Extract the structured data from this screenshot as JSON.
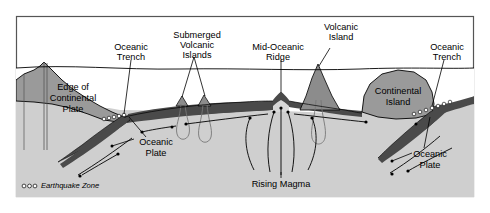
{
  "figure": {
    "kind": "cross-section-diagram",
    "background_color": "#ffffff",
    "border_color": "#555555"
  },
  "palette": {
    "water": "#ffffff",
    "mantle": "#cfcfcf",
    "continental_crust": "#9a9a9a",
    "oceanic_plate": "#4a4a4a",
    "ridge_magma": "#d8d8d8",
    "line": "#000000",
    "earthquake_dot_fill": "#ffffff"
  },
  "labels": {
    "oceanic_trench_left": "Oceanic\nTrench",
    "oceanic_trench_left_line1": "Oceanic",
    "oceanic_trench_left_line2": "Trench",
    "submerged_volcanic_islands_line1": "Submerged",
    "submerged_volcanic_islands_line2": "Volcanic",
    "submerged_volcanic_islands_line3": "Islands",
    "mid_oceanic_ridge_line1": "Mid-Oceanic",
    "mid_oceanic_ridge_line2": "Ridge",
    "volcanic_island_line1": "Volcanic",
    "volcanic_island_line2": "Island",
    "oceanic_trench_right_line1": "Oceanic",
    "oceanic_trench_right_line2": "Trench",
    "edge_of_continental_plate_line1": "Edge of",
    "edge_of_continental_plate_line2": "Continental",
    "edge_of_continental_plate_line3": "Plate",
    "continental_island_line1": "Continental",
    "continental_island_line2": "Island",
    "oceanic_plate_left_line1": "Oceanic",
    "oceanic_plate_left_line2": "Plate",
    "oceanic_plate_right_line1": "Oceanic",
    "oceanic_plate_right_line2": "Plate",
    "rising_magma": "Rising Magma"
  },
  "legend": {
    "earthquake_zone_text": "Earthquake Zone",
    "earthquake_zone_marker": "ooo"
  }
}
